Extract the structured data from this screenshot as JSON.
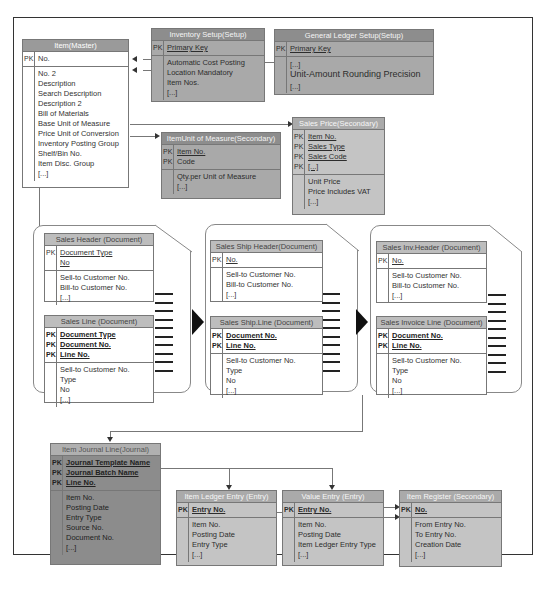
{
  "diagram": {
    "item_master": {
      "title": "Item(Master)",
      "pk_labels": [
        "PK"
      ],
      "pk_fields": [
        "No."
      ],
      "fields": [
        "No. 2",
        "Description",
        "Search Description",
        "Description 2",
        "Bill of Materials",
        "Base Unit of Measure",
        "Price Unit of Conversion",
        "Inventory Posting Group",
        "Shelf/Bin No.",
        "Item Disc. Group",
        "[...]"
      ]
    },
    "inventory_setup": {
      "title": "Inventory Setup(Setup)",
      "pk_labels": [
        "PK"
      ],
      "pk_fields": [
        "Primary Key"
      ],
      "fields": [
        "Automatic Cost Posting",
        "Location Mandatory",
        "Item Nos.",
        "[...]"
      ]
    },
    "gl_setup": {
      "title": "General Ledger Setup(Setup)",
      "pk_labels": [
        "PK"
      ],
      "pk_fields": [
        "Primary Key"
      ],
      "fields": [
        "[...]",
        "Unit-Amount Rounding Precision",
        "[...]"
      ]
    },
    "item_uom": {
      "title": "ItemUnit of Measure(Secondary)",
      "pk_labels": [
        "PK",
        "PK"
      ],
      "pk_fields": [
        "Item No.",
        "Code"
      ],
      "fields": [
        "Qty.per Unit of Measure",
        "[...]"
      ]
    },
    "sales_price": {
      "title": "Sales Price(Secondary)",
      "pk_labels": [
        "PK",
        "PK",
        "PK",
        "PK"
      ],
      "pk_fields": [
        "Item No.",
        "Sales Type",
        "Sales Code",
        "[...]"
      ],
      "fields": [
        "Unit Price",
        "Price Includes VAT",
        "[...]"
      ]
    },
    "sales_header": {
      "title": "Sales Header (Document)",
      "pk_labels": [
        "PK",
        ""
      ],
      "pk_fields": [
        "Document Type",
        "No"
      ],
      "fields": [
        "Sell-to Customer No.",
        "Bill-to Customer No.",
        "[...]"
      ]
    },
    "sales_line": {
      "title": "Sales Line (Document)",
      "pk_labels": [
        "PK",
        "PK",
        "PK"
      ],
      "pk_fields": [
        "Document Type",
        "Document No.",
        "Line No."
      ],
      "fields": [
        "Sell-to Customer No.",
        "Type",
        "No",
        "[...]"
      ]
    },
    "sales_ship_header": {
      "title": "Sales Ship Header(Document)",
      "pk_labels": [
        "PK"
      ],
      "pk_fields": [
        "No."
      ],
      "fields": [
        "Sell-to Customer No.",
        "Bill-to Customer No.",
        "[...]"
      ]
    },
    "sales_ship_line": {
      "title": "Sales Ship.Line (Document)",
      "pk_labels": [
        "PK",
        "PK"
      ],
      "pk_fields": [
        "Document No.",
        "Line No."
      ],
      "fields": [
        "Sell-to Customer No.",
        "Type",
        "No",
        "[...]"
      ]
    },
    "sales_inv_header": {
      "title": "Sales Inv.Header (Document)",
      "pk_labels": [
        "PK"
      ],
      "pk_fields": [
        "No."
      ],
      "fields": [
        "Sell-to Customer No.",
        "Bill-to Customer No.",
        "[...]"
      ]
    },
    "sales_invoice_line": {
      "title": "Sales Invoice Line (Document)",
      "pk_labels": [
        "PK",
        "PK"
      ],
      "pk_fields": [
        "Document No.",
        "Line No."
      ],
      "fields": [
        "Sell-to Customer No.",
        "Type",
        "No",
        "[...]"
      ]
    },
    "item_journal_line": {
      "title": "Item Journal Line(Journal)",
      "pk_labels": [
        "PK",
        "PK",
        "PK"
      ],
      "pk_fields": [
        "Journal Template Name",
        "Journal Batch Name",
        "Line No."
      ],
      "fields": [
        "Item No.",
        "Posting Date",
        "Entry Type",
        "Source No.",
        "Document No.",
        "[...]"
      ]
    },
    "item_ledger_entry": {
      "title": "Item Ledger Entry (Entry)",
      "pk_labels": [
        "PK"
      ],
      "pk_fields": [
        "Entry No."
      ],
      "fields": [
        "Item No.",
        "Posting Date",
        "Entry Type",
        "[...]"
      ]
    },
    "value_entry": {
      "title": "Value Entry (Entry)",
      "pk_labels": [
        "PK"
      ],
      "pk_fields": [
        "Entry No."
      ],
      "fields": [
        "Item No.",
        "Posting Date",
        "Item Ledger Entry Type",
        "[...]"
      ]
    },
    "item_register": {
      "title": "Item Register (Secondary)",
      "pk_labels": [
        "PK"
      ],
      "pk_fields": [
        "No."
      ],
      "fields": [
        "From Entry No.",
        "To Entry No.",
        "Creation Date",
        "[...]"
      ]
    }
  }
}
